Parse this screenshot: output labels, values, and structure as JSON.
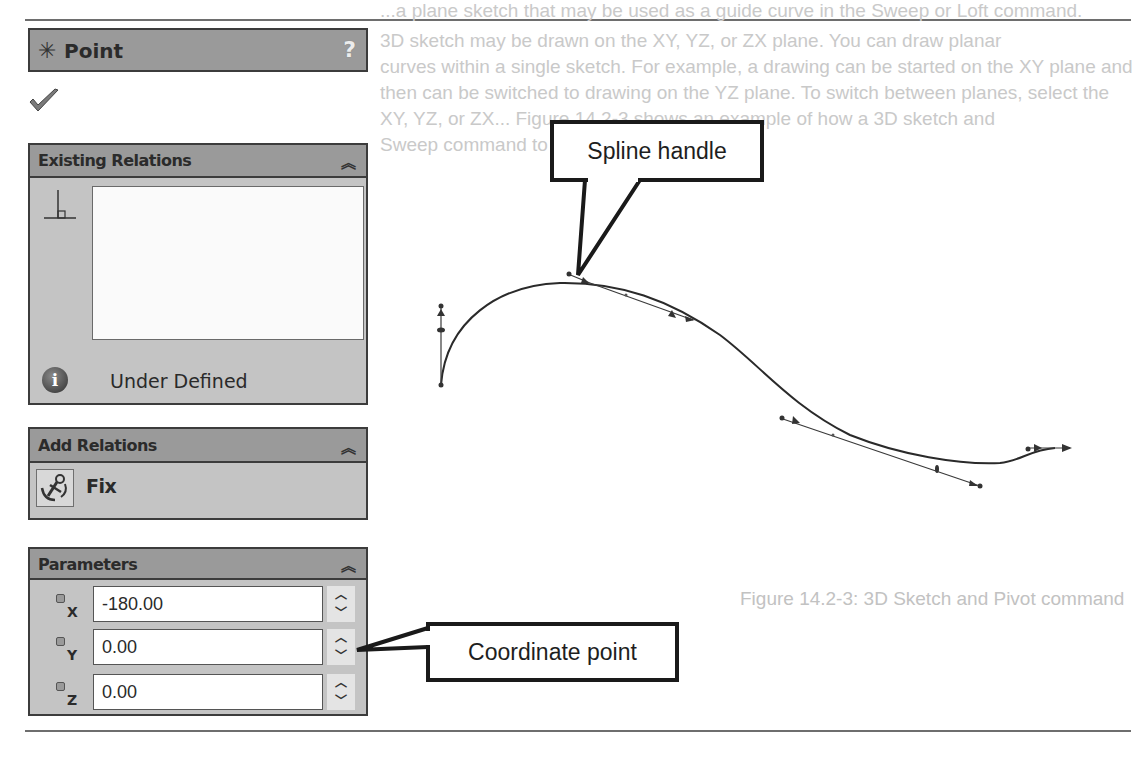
{
  "background_text": {
    "lines": [
      "...a plane sketch that may be used as a guide curve in the Sweep or Loft command.",
      "3D sketch may be drawn on the XY, YZ, or ZX plane. You can draw planar",
      "curves within a single sketch. For example, a drawing can be started on the XY plane and",
      "then can be switched to drawing on the YZ plane. To switch between planes, select the",
      "XY, YZ, or ZX... Figure 14.2-3 shows an example of how a 3D sketch and",
      "Sweep command to create a pipe."
    ],
    "figure_caption": "Figure 14.2-3: 3D Sketch and Pivot command"
  },
  "panel": {
    "title": "Point",
    "title_icon": "asterisk-point-icon",
    "help_label": "?",
    "ok_icon": "checkmark-icon",
    "sections": {
      "existing_relations": {
        "title": "Existing Relations",
        "collapse_glyph": "≫",
        "relations": [],
        "status": "Under Defined"
      },
      "add_relations": {
        "title": "Add Relations",
        "collapse_glyph": "≫",
        "items": [
          {
            "label": "Fix",
            "icon": "anchor-icon"
          }
        ]
      },
      "parameters": {
        "title": "Parameters",
        "collapse_glyph": "≫",
        "fields": [
          {
            "axis": "X",
            "value": "-180.00"
          },
          {
            "axis": "Y",
            "value": "0.00"
          },
          {
            "axis": "Z",
            "value": "0.00"
          }
        ],
        "spin_up": "^",
        "spin_down": "v"
      }
    }
  },
  "callouts": {
    "spline_handle": "Spline handle",
    "coordinate_point": "Coordinate point"
  },
  "colors": {
    "header_bg": "#9a9a9a",
    "body_bg": "#c4c4c4",
    "border": "#3c3c3c",
    "curve": "#2a2a2a"
  }
}
